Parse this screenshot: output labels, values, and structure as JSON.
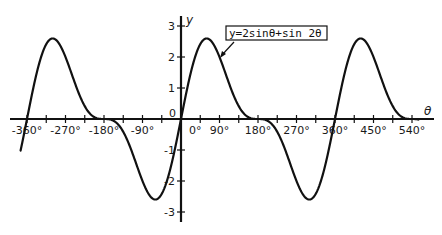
{
  "chart_data": {
    "type": "line",
    "title": "",
    "annotation": "y=2sinθ+sin 2θ",
    "xlabel": "θ",
    "ylabel": "y",
    "x_unit": "degrees",
    "xlim": [
      -375,
      555
    ],
    "ylim": [
      -3.2,
      3.2
    ],
    "x_ticks": [
      -360,
      -270,
      -180,
      -90,
      0,
      90,
      180,
      270,
      360,
      450,
      540
    ],
    "x_tick_labels": [
      "-360°",
      "-270°",
      "-180°",
      "-90°",
      "0°",
      "90°",
      "180°",
      "270°",
      "360°",
      "450°",
      "540°"
    ],
    "x_minor_tick_step": 45,
    "y_ticks": [
      -3,
      -2,
      -1,
      0,
      1,
      2,
      3
    ],
    "y_tick_labels": [
      "-3",
      "-2",
      "-1",
      "0",
      "1",
      "2",
      "3"
    ],
    "grid": false,
    "legend": {
      "position": "annotation box with arrow pointing to curve near θ≈75°"
    },
    "series": [
      {
        "name": "y=2sinθ+sin 2θ",
        "x": [
          -360,
          -300,
          -270,
          -240,
          -180,
          -120,
          -90,
          -60,
          0,
          60,
          90,
          120,
          180,
          240,
          270,
          300,
          360,
          420,
          450,
          480,
          540
        ],
        "values": [
          0,
          2.6,
          2.0,
          0.87,
          0,
          -0.87,
          -2.0,
          -2.6,
          0,
          2.6,
          2.0,
          0.87,
          0,
          -0.87,
          -2.0,
          -2.6,
          0,
          2.6,
          2.0,
          0.87,
          0
        ]
      }
    ]
  },
  "labels": {
    "origin": "0",
    "x_axis_name": "θ",
    "y_axis_name": "y",
    "annotation": "y=2sinθ+sin 2θ"
  }
}
